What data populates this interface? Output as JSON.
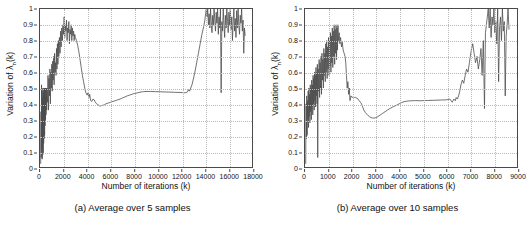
{
  "figure": {
    "background": "#ffffff",
    "line_color": "#4d4d4d",
    "grid_color": "#b9b9b9",
    "axis_color": "#4a4a4a"
  },
  "chart_data": [
    {
      "type": "line",
      "panel_id": "a",
      "caption": "(a) Average over 5 samples",
      "title": "",
      "xlabel": "Number of iterations  (k)",
      "ylabel": "Variation of λ",
      "ylabel_sub": "n",
      "ylabel_suffix": "(k)",
      "xlim": [
        0,
        18000
      ],
      "ylim": [
        0,
        1
      ],
      "grid": true,
      "legend": "none",
      "xticks": [
        0,
        2000,
        4000,
        6000,
        8000,
        10000,
        12000,
        14000,
        16000,
        18000
      ],
      "xtick_labels": [
        "0",
        "2000",
        "4000",
        "6000",
        "8000",
        "10000",
        "12000",
        "14000",
        "16000",
        "18000"
      ],
      "yticks": [
        0,
        0.1,
        0.2,
        0.3,
        0.4,
        0.5,
        0.6,
        0.7,
        0.8,
        0.9,
        1
      ],
      "ytick_labels": [
        "0",
        "0.1",
        "0.2",
        "0.3",
        "0.4",
        "0.5",
        "0.6",
        "0.7",
        "0.8",
        "0.9",
        "1"
      ],
      "series": [
        {
          "name": "Variation of lambda_n(k), 5-sample average",
          "x": [
            60,
            90,
            110,
            130,
            150,
            170,
            190,
            210,
            230,
            250,
            270,
            290,
            310,
            330,
            350,
            370,
            390,
            410,
            430,
            450,
            470,
            490,
            510,
            540,
            570,
            600,
            640,
            680,
            720,
            760,
            800,
            840,
            880,
            920,
            960,
            1000,
            1040,
            1080,
            1120,
            1160,
            1200,
            1240,
            1280,
            1320,
            1360,
            1400,
            1440,
            1480,
            1520,
            1560,
            1600,
            1650,
            1700,
            1750,
            1800,
            1850,
            1900,
            1950,
            2000,
            2050,
            2100,
            2150,
            2200,
            2250,
            2300,
            2350,
            2400,
            2450,
            2500,
            2550,
            2600,
            2650,
            2700,
            2750,
            2800,
            2850,
            2900,
            2950,
            3000,
            3100,
            3200,
            3300,
            3400,
            3500,
            3600,
            3700,
            3800,
            3900,
            4000,
            4080,
            4150,
            4220,
            4300,
            4400,
            4500,
            4600,
            4700,
            4800,
            4900,
            5000,
            5100,
            5200,
            5300,
            5400,
            5500,
            5600,
            5800,
            6000,
            6200,
            6400,
            6600,
            6800,
            7000,
            7200,
            7400,
            7600,
            7800,
            8000,
            8200,
            8400,
            8600,
            8800,
            9000,
            9400,
            9800,
            10200,
            10600,
            11000,
            11400,
            11800,
            12100,
            12300,
            12450,
            12520,
            12600,
            12700,
            12800,
            12900,
            13000,
            13150,
            13300,
            13450,
            13600,
            13750,
            13900,
            14000,
            14060,
            14120,
            14180,
            14240,
            14300,
            14360,
            14420,
            14480,
            14540,
            14600,
            14660,
            14720,
            14780,
            14840,
            14900,
            14960,
            15020,
            15080,
            15140,
            15200,
            15260,
            15320,
            15380,
            15440,
            15500,
            15560,
            15620,
            15680,
            15740,
            15800,
            15860,
            15920,
            15980,
            16040,
            16100,
            16160,
            16220,
            16280,
            16340,
            16400,
            16460,
            16520,
            16580,
            16640,
            16700,
            16760,
            16820,
            16880,
            16940,
            17000,
            17060,
            17120,
            17180,
            17240,
            17300,
            17360,
            17420
          ],
          "y": [
            0.02,
            0.35,
            0.06,
            0.52,
            0.12,
            0.48,
            0.05,
            0.44,
            0.1,
            0.5,
            0.08,
            0.47,
            0.15,
            0.5,
            0.18,
            0.49,
            0.2,
            0.5,
            0.26,
            0.5,
            0.3,
            0.5,
            0.33,
            0.5,
            0.36,
            0.5,
            0.41,
            0.58,
            0.36,
            0.56,
            0.45,
            0.62,
            0.4,
            0.6,
            0.5,
            0.65,
            0.48,
            0.67,
            0.55,
            0.7,
            0.52,
            0.72,
            0.6,
            0.66,
            0.58,
            0.75,
            0.62,
            0.78,
            0.65,
            0.8,
            0.7,
            0.82,
            0.72,
            0.86,
            0.76,
            0.88,
            0.8,
            0.9,
            0.84,
            0.95,
            0.82,
            0.9,
            0.86,
            0.93,
            0.8,
            0.88,
            0.85,
            0.92,
            0.78,
            0.87,
            0.84,
            0.9,
            0.8,
            0.88,
            0.83,
            0.86,
            0.8,
            0.84,
            0.82,
            0.8,
            0.77,
            0.73,
            0.68,
            0.63,
            0.58,
            0.54,
            0.5,
            0.47,
            0.455,
            0.47,
            0.44,
            0.46,
            0.42,
            0.415,
            0.43,
            0.425,
            0.41,
            0.4,
            0.395,
            0.39,
            0.385,
            0.388,
            0.39,
            0.392,
            0.395,
            0.4,
            0.405,
            0.41,
            0.415,
            0.42,
            0.425,
            0.43,
            0.437,
            0.443,
            0.45,
            0.455,
            0.46,
            0.465,
            0.468,
            0.472,
            0.475,
            0.477,
            0.478,
            0.478,
            0.477,
            0.476,
            0.475,
            0.474,
            0.473,
            0.472,
            0.471,
            0.47,
            0.472,
            0.475,
            0.49,
            0.48,
            0.5,
            0.52,
            0.55,
            0.6,
            0.66,
            0.72,
            0.78,
            0.84,
            0.89,
            0.93,
            0.97,
            1.0,
            0.95,
            1.0,
            0.9,
            0.97,
            0.88,
            1.0,
            0.92,
            0.85,
            0.96,
            0.9,
            1.0,
            0.93,
            0.86,
            0.98,
            0.91,
            1.0,
            0.84,
            0.95,
            0.88,
            1.0,
            0.47,
            0.92,
            0.86,
            1.0,
            0.9,
            0.82,
            0.96,
            0.88,
            1.0,
            0.93,
            0.85,
            0.98,
            0.9,
            1.0,
            0.87,
            0.95,
            0.8,
            0.92,
            1.0,
            0.86,
            0.94,
            0.82,
            0.99,
            0.88,
            1.0,
            0.9,
            0.84,
            0.96,
            0.91,
            1.0,
            0.86,
            0.93,
            0.72,
            0.88,
            0.83,
            0.9,
            0.76
          ]
        }
      ]
    },
    {
      "type": "line",
      "panel_id": "b",
      "caption": "(b) Average over 10 samples",
      "title": "",
      "xlabel": "Number of iterations  (k)",
      "ylabel": "Variation of λ",
      "ylabel_sub": "n",
      "ylabel_suffix": "(k)",
      "xlim": [
        0,
        9000
      ],
      "ylim": [
        0,
        1
      ],
      "grid": true,
      "legend": "none",
      "xticks": [
        0,
        1000,
        2000,
        3000,
        4000,
        5000,
        6000,
        7000,
        8000,
        9000
      ],
      "xtick_labels": [
        "0",
        "1000",
        "2000",
        "3000",
        "4000",
        "5000",
        "6000",
        "7000",
        "8000",
        "9000"
      ],
      "yticks": [
        0,
        0.1,
        0.2,
        0.3,
        0.4,
        0.5,
        0.6,
        0.7,
        0.8,
        0.9,
        1
      ],
      "ytick_labels": [
        "0",
        "0.1",
        "0.2",
        "0.3",
        "0.4",
        "0.5",
        "0.6",
        "0.7",
        "0.8",
        "0.9",
        "1"
      ],
      "series": [
        {
          "name": "Variation of lambda_n(k), 10-sample average",
          "x": [
            30,
            45,
            60,
            75,
            90,
            105,
            120,
            135,
            150,
            165,
            180,
            195,
            210,
            225,
            240,
            255,
            270,
            285,
            300,
            315,
            330,
            345,
            360,
            375,
            390,
            405,
            420,
            435,
            450,
            465,
            480,
            495,
            510,
            525,
            540,
            560,
            580,
            600,
            620,
            640,
            660,
            680,
            700,
            720,
            740,
            760,
            780,
            800,
            820,
            840,
            860,
            880,
            900,
            920,
            940,
            960,
            980,
            1000,
            1020,
            1040,
            1060,
            1080,
            1100,
            1120,
            1140,
            1160,
            1180,
            1200,
            1220,
            1240,
            1260,
            1280,
            1300,
            1320,
            1340,
            1360,
            1380,
            1400,
            1420,
            1450,
            1480,
            1510,
            1550,
            1580,
            1620,
            1660,
            1700,
            1730,
            1760,
            1790,
            1820,
            1850,
            1880,
            1910,
            1950,
            2000,
            2050,
            2100,
            2150,
            2200,
            2250,
            2300,
            2350,
            2400,
            2450,
            2500,
            2560,
            2620,
            2680,
            2740,
            2800,
            2860,
            2920,
            2980,
            3040,
            3100,
            3200,
            3300,
            3400,
            3500,
            3600,
            3700,
            3800,
            3900,
            4000,
            4100,
            4200,
            4300,
            4400,
            4500,
            4600,
            4700,
            4800,
            4900,
            5000,
            5200,
            5400,
            5600,
            5800,
            6000,
            6150,
            6250,
            6320,
            6380,
            6420,
            6470,
            6520,
            6570,
            6620,
            6680,
            6740,
            6800,
            6860,
            6920,
            6980,
            7020,
            7060,
            7120,
            7180,
            7240,
            7300,
            7360,
            7420,
            7470,
            7520,
            7570,
            7620,
            7660,
            7700,
            7740,
            7780,
            7820,
            7860,
            7900,
            7940,
            7980,
            8020,
            8060,
            8100,
            8140,
            8180,
            8220,
            8260,
            8300,
            8340,
            8380,
            8420,
            8460,
            8500,
            8540,
            8580,
            8620,
            8660
          ],
          "y": [
            0.02,
            0.4,
            0.18,
            0.45,
            0.2,
            0.42,
            0.3,
            0.48,
            0.25,
            0.5,
            0.32,
            0.46,
            0.28,
            0.52,
            0.35,
            0.5,
            0.3,
            0.55,
            0.38,
            0.52,
            0.33,
            0.58,
            0.4,
            0.56,
            0.36,
            0.6,
            0.42,
            0.58,
            0.38,
            0.63,
            0.45,
            0.6,
            0.4,
            0.65,
            0.06,
            0.62,
            0.48,
            0.68,
            0.44,
            0.66,
            0.5,
            0.7,
            0.46,
            0.72,
            0.55,
            0.68,
            0.5,
            0.75,
            0.58,
            0.72,
            0.54,
            0.78,
            0.6,
            0.8,
            0.56,
            0.76,
            0.62,
            0.82,
            0.58,
            0.8,
            0.64,
            0.85,
            0.6,
            0.83,
            0.66,
            0.88,
            0.63,
            0.86,
            0.7,
            0.9,
            0.65,
            0.87,
            0.72,
            0.9,
            0.68,
            0.88,
            0.74,
            0.9,
            0.8,
            0.85,
            0.78,
            0.82,
            0.76,
            0.79,
            0.74,
            0.72,
            0.7,
            0.66,
            0.58,
            0.5,
            0.54,
            0.46,
            0.5,
            0.42,
            0.45,
            0.44,
            0.445,
            0.44,
            0.44,
            0.435,
            0.43,
            0.42,
            0.41,
            0.4,
            0.38,
            0.36,
            0.345,
            0.335,
            0.325,
            0.318,
            0.313,
            0.31,
            0.31,
            0.311,
            0.313,
            0.32,
            0.33,
            0.34,
            0.35,
            0.36,
            0.37,
            0.378,
            0.385,
            0.392,
            0.4,
            0.408,
            0.413,
            0.416,
            0.418,
            0.419,
            0.42,
            0.42,
            0.42,
            0.419,
            0.42,
            0.421,
            0.422,
            0.423,
            0.424,
            0.425,
            0.43,
            0.41,
            0.43,
            0.42,
            0.44,
            0.43,
            0.45,
            0.48,
            0.52,
            0.55,
            0.53,
            0.58,
            0.62,
            0.6,
            0.66,
            0.7,
            0.74,
            0.78,
            0.72,
            0.66,
            0.7,
            0.62,
            0.68,
            0.75,
            0.58,
            0.8,
            0.37,
            0.85,
            0.9,
            0.95,
            1.0,
            0.88,
            1.0,
            0.82,
            0.95,
            0.9,
            1.0,
            0.85,
            0.92,
            0.78,
            1.0,
            0.54,
            0.88,
            0.95,
            0.8,
            1.0,
            0.86,
            0.92,
            0.45,
            0.83,
            0.9,
            1.0,
            0.87,
            0.95,
            0.9
          ]
        }
      ]
    }
  ]
}
